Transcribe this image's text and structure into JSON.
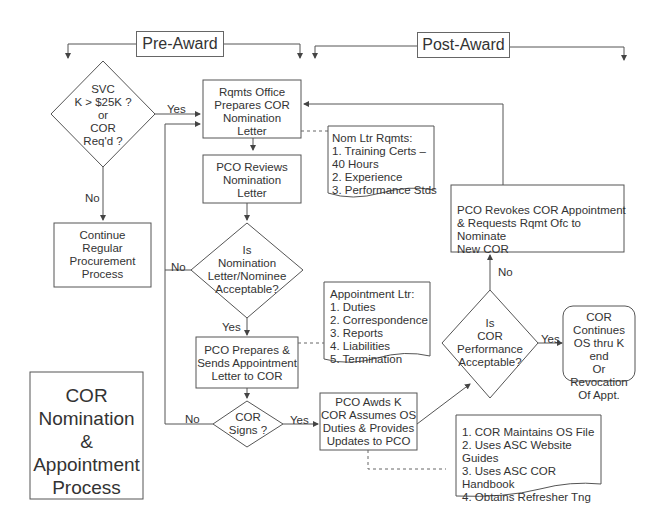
{
  "headers": {
    "pre_award": "Pre-Award",
    "post_award": "Post-Award"
  },
  "title_box": "COR\nNomination\n&\nAppointment\nProcess",
  "nodes": {
    "svc_decision": "SVC\nK > $25K ?\nor\nCOR\nReq'd ?",
    "continue_regular": "Continue\nRegular\nProcurement\nProcess",
    "rqmts_office": "Rqmts Office\nPrepares COR\nNomination\nLetter",
    "pco_reviews": "PCO Reviews\nNomination\nLetter",
    "nomination_acceptable": "Is\nNomination\nLetter/Nominee\nAcceptable?",
    "pco_prepares": "PCO Prepares &\nSends Appointment\nLetter to COR",
    "cor_signs": "COR\nSigns ?",
    "pco_awds": "PCO Awds K\nCOR Assumes OS\nDuties & Provides\nUpdates to PCO",
    "performance_acceptable": "Is\nCOR\nPerformance\nAcceptable?",
    "cor_continues": "COR\nContinues\nOS thru K end\nOr Revocation\nOf Appt.",
    "pco_revokes": "PCO Revokes COR Appointment\n& Requests Rqmt Ofc to Nominate\nNew COR"
  },
  "documents": {
    "nom_ltr": "Nom Ltr Rqmts:\n1. Training Certs –\n      40 Hours\n2. Experience\n3. Performance Stds",
    "appointment_ltr": "Appointment Ltr:\n1. Duties\n2. Correspondence\n3. Reports\n4. Liabilities\n5. Termination",
    "cor_duties": "1. COR Maintains OS File\n2. Uses ASC Website Guides\n3. Uses ASC COR Handbook\n4. Obtains Refresher Tng"
  },
  "edge_labels": {
    "svc_yes": "Yes",
    "svc_no": "No",
    "nom_no": "No",
    "nom_yes": "Yes",
    "signs_no": "No",
    "signs_yes": "Yes",
    "perf_yes": "Yes",
    "perf_no": "No"
  },
  "colors": {
    "stroke": "#555555",
    "text": "#333333",
    "background": "#ffffff"
  }
}
